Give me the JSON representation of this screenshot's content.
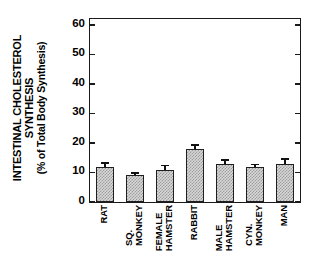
{
  "chart_data": {
    "type": "bar",
    "title": "",
    "xlabel": "",
    "ylabel": "INTESTINAL CHOLESTEROL SYNTHESIS (% of Total Body Synthesis)",
    "ylabel_lines": [
      "INTESTINAL CHOLESTEROL",
      "SYNTHESIS",
      "(% of Total Body Synthesis)"
    ],
    "categories": [
      "RAT",
      "SQ. MONKEY",
      "FEMALE HAMSTER",
      "RABBIT",
      "MALE HAMSTER",
      "CYN. MONKEY",
      "MAN"
    ],
    "category_label_lines": [
      [
        "RAT"
      ],
      [
        "SQ.",
        "MONKEY"
      ],
      [
        "FEMALE",
        "HAMSTER"
      ],
      [
        "RABBIT"
      ],
      [
        "MALE",
        "HAMSTER"
      ],
      [
        "CYN.",
        "MONKEY"
      ],
      [
        "MAN"
      ]
    ],
    "values": [
      12,
      9,
      11,
      18,
      13,
      12,
      13
    ],
    "errors": [
      1.5,
      1.0,
      1.5,
      1.5,
      1.5,
      1.0,
      1.8
    ],
    "ylim": [
      0,
      62
    ],
    "yticks": [
      0,
      10,
      20,
      30,
      40,
      50,
      60
    ],
    "ytick_labels": [
      "0",
      "10",
      "20",
      "30",
      "40",
      "50",
      "60"
    ],
    "grid": false,
    "legend": null,
    "bar_fill": "#d7d7d7",
    "bar_edge": "#1f1f1f",
    "axis_color": "#1a1a1a"
  }
}
